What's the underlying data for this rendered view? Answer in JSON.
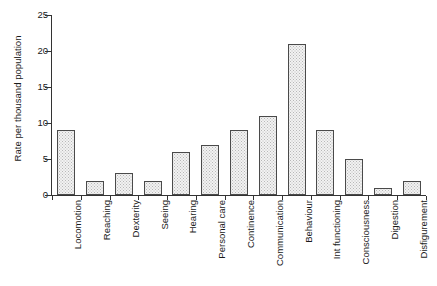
{
  "chart_data": {
    "type": "bar",
    "title": "",
    "subtitle": "",
    "xlabel": "",
    "ylabel": "Rate per thousand population",
    "ylim": [
      0,
      25
    ],
    "ytick_labels": [
      "0",
      "5",
      "10",
      "15",
      "20",
      "25"
    ],
    "ytick_values": [
      0,
      5,
      10,
      15,
      20,
      25
    ],
    "grid": false,
    "legend": false,
    "legend_position": "none",
    "categories": [
      "Locomotion",
      "Reaching",
      "Dexterity",
      "Seeing",
      "Hearing",
      "Personal care",
      "Continence",
      "Communication",
      "Behaviour",
      "Int functioning",
      "Consciousness",
      "Digestion",
      "Disfigurement"
    ],
    "values": [
      9,
      2,
      3,
      2,
      6,
      7,
      9,
      11,
      21,
      9,
      5,
      1,
      2
    ],
    "bar_style": {
      "fill": "#f2f2f2",
      "pattern": "stippled-dots",
      "pattern_color": "#b8b8b8",
      "border": "#4a4a4a"
    },
    "axis_color": "#333333",
    "background": "#ffffff"
  }
}
